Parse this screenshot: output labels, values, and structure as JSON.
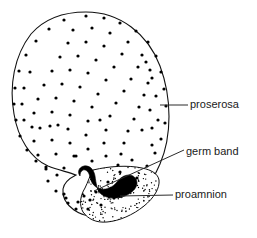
{
  "figure": {
    "background_color": "#ffffff",
    "ink_color": "#111111",
    "width": 257,
    "height": 238
  },
  "labels": [
    {
      "id": "proserosa",
      "text": "proserosa",
      "x": 190,
      "y": 105,
      "leader": {
        "x1": 160,
        "y1": 105,
        "x2": 188,
        "y2": 105
      }
    },
    {
      "id": "germ-band",
      "text": "germ band",
      "x": 186,
      "y": 152,
      "leader": {
        "x1": 94,
        "y1": 191,
        "x2": 184,
        "y2": 150
      }
    },
    {
      "id": "proamnion",
      "text": "proamnion",
      "x": 175,
      "y": 195,
      "leader": {
        "x1": 120,
        "y1": 196,
        "x2": 173,
        "y2": 195
      }
    }
  ],
  "structures": {
    "proserosa": {
      "name": "proserosa",
      "description": "outer egg region covered with evenly scattered nuclei dots",
      "fill": "#ffffff",
      "dot_color": "#000000"
    },
    "germ_band": {
      "name": "germ band",
      "description": "solid black comb-toothed band at the ventral posterior pole",
      "fill": "#000000"
    },
    "proamnion": {
      "name": "proamnion",
      "description": "finely stippled lobe enclosing the germ band",
      "fill": "#ffffff",
      "stipple_color": "#000000"
    }
  },
  "geometry": {
    "egg_outline_path": "M 86 12 C 120 12 148 34 160 66 C 172 98 172 136 160 164 C 150 188 132 206 112 213 C 98 218 84 217 74 210 C 66 204 62 196 63 189 C 64 182 70 178 76 175 C 68 172 58 170 48 166 C 30 158 18 138 14 114 C 9 86 14 56 31 34 C 45 18 66 12 86 12 Z",
    "proamnion_path": "M 93 170 C 110 166 128 165 142 168 C 152 170 158 174 159 180 C 160 188 154 198 144 206 C 133 215 119 221 107 222 C 96 223 88 219 83 212 C 79 205 80 196 85 188 C 88 182 90 175 93 170 Z",
    "germ_band_path": "M 80 176 C 77 172 79 167 84 166 C 90 165 94 170 95 176 C 96 183 97 190 101 194 C 107 199 117 199 125 196 C 132 193 137 188 137 183 C 137 178 133 175 129 175 C 124 175 120 178 117 182 C 113 187 107 190 101 189 C 95 188 91 183 90 177 C 89 172 86 169 83 170 C 81 171 80 173 80 176 Z"
  },
  "nuclei_dots": [
    [
      86,
      16
    ],
    [
      104,
      18
    ],
    [
      120,
      23
    ],
    [
      136,
      31
    ],
    [
      148,
      42
    ],
    [
      156,
      56
    ],
    [
      161,
      72
    ],
    [
      164,
      89
    ],
    [
      166,
      106
    ],
    [
      165,
      123
    ],
    [
      161,
      139
    ],
    [
      155,
      153
    ],
    [
      147,
      166
    ],
    [
      137,
      178
    ],
    [
      126,
      189
    ],
    [
      114,
      198
    ],
    [
      101,
      205
    ],
    [
      88,
      209
    ],
    [
      76,
      209
    ],
    [
      68,
      203
    ],
    [
      64,
      194
    ],
    [
      57,
      175
    ],
    [
      46,
      169
    ],
    [
      36,
      161
    ],
    [
      27,
      150
    ],
    [
      20,
      136
    ],
    [
      16,
      120
    ],
    [
      14,
      104
    ],
    [
      15,
      88
    ],
    [
      19,
      71
    ],
    [
      26,
      55
    ],
    [
      36,
      41
    ],
    [
      49,
      29
    ],
    [
      64,
      20
    ],
    [
      73,
      30
    ],
    [
      92,
      28
    ],
    [
      110,
      33
    ],
    [
      128,
      42
    ],
    [
      142,
      55
    ],
    [
      150,
      70
    ],
    [
      68,
      43
    ],
    [
      86,
      42
    ],
    [
      104,
      46
    ],
    [
      122,
      54
    ],
    [
      138,
      67
    ],
    [
      148,
      83
    ],
    [
      60,
      57
    ],
    [
      78,
      56
    ],
    [
      96,
      60
    ],
    [
      114,
      67
    ],
    [
      131,
      79
    ],
    [
      144,
      95
    ],
    [
      52,
      71
    ],
    [
      70,
      70
    ],
    [
      88,
      73
    ],
    [
      106,
      80
    ],
    [
      124,
      91
    ],
    [
      139,
      107
    ],
    [
      44,
      85
    ],
    [
      62,
      84
    ],
    [
      80,
      87
    ],
    [
      98,
      94
    ],
    [
      116,
      103
    ],
    [
      134,
      119
    ],
    [
      38,
      99
    ],
    [
      56,
      98
    ],
    [
      74,
      101
    ],
    [
      92,
      107
    ],
    [
      110,
      116
    ],
    [
      128,
      131
    ],
    [
      34,
      113
    ],
    [
      52,
      112
    ],
    [
      70,
      115
    ],
    [
      88,
      121
    ],
    [
      106,
      130
    ],
    [
      124,
      143
    ],
    [
      32,
      127
    ],
    [
      50,
      126
    ],
    [
      68,
      129
    ],
    [
      86,
      135
    ],
    [
      104,
      143
    ],
    [
      121,
      154
    ],
    [
      34,
      141
    ],
    [
      52,
      140
    ],
    [
      70,
      143
    ],
    [
      88,
      149
    ],
    [
      106,
      156
    ],
    [
      118,
      165
    ],
    [
      38,
      155
    ],
    [
      56,
      154
    ],
    [
      74,
      156
    ],
    [
      92,
      161
    ],
    [
      46,
      167
    ],
    [
      64,
      168
    ],
    [
      48,
      181
    ],
    [
      56,
      191
    ],
    [
      66,
      198
    ],
    [
      78,
      202
    ],
    [
      90,
      200
    ],
    [
      40,
      128
    ],
    [
      24,
      120
    ],
    [
      22,
      104
    ],
    [
      24,
      88
    ],
    [
      30,
      72
    ],
    [
      58,
      125
    ],
    [
      76,
      156
    ],
    [
      100,
      120
    ],
    [
      142,
      130
    ],
    [
      150,
      110
    ],
    [
      152,
      128
    ],
    [
      132,
      160
    ],
    [
      120,
      172
    ],
    [
      108,
      182
    ],
    [
      96,
      192
    ],
    [
      84,
      196
    ],
    [
      152,
      145
    ],
    [
      158,
      120
    ],
    [
      156,
      96
    ],
    [
      152,
      78
    ],
    [
      146,
      62
    ]
  ],
  "stipple_seed": {
    "count": 260,
    "dot_radius": 0.7
  }
}
